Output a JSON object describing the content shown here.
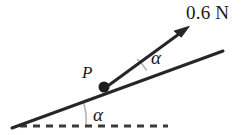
{
  "figure": {
    "background_color": "#ffffff",
    "width": 250,
    "height": 135,
    "labels": {
      "force_magnitude": "0.6 N",
      "point": "P",
      "angle_upper": "α",
      "angle_lower": "α"
    },
    "colors": {
      "stroke": "#262626",
      "arc": "#b5b5b5",
      "dash": "#3a3a3a",
      "text": "#1a1a1a"
    },
    "geometry": {
      "incline": {
        "x1": 12,
        "y1": 128,
        "x2": 223,
        "y2": 51,
        "stroke_width": 3
      },
      "dashed_ground": {
        "x1": 20,
        "y1": 126,
        "x2": 168,
        "y2": 126,
        "stroke_width": 3,
        "dash_pattern": "7 6"
      },
      "force_arrow": {
        "x1": 105,
        "y1": 88,
        "x2": 186,
        "y2": 29,
        "stroke_width": 3
      },
      "point_dot": {
        "cx": 104,
        "cy": 87,
        "r": 5.5
      },
      "arc_upper": {
        "cx": 105,
        "cy": 88,
        "r": 46
      },
      "arc_lower": {
        "cx": 20,
        "cy": 126,
        "r": 66
      }
    }
  }
}
